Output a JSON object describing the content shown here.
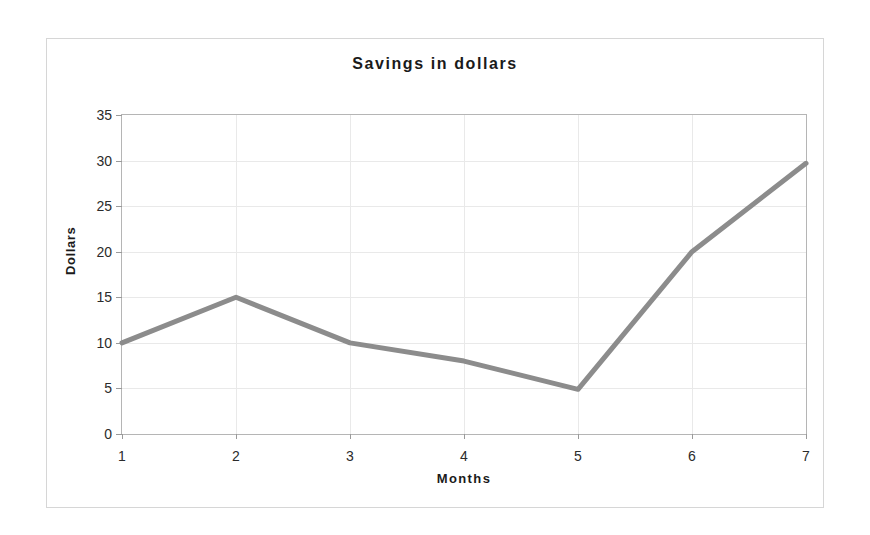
{
  "chart_data": {
    "type": "line",
    "title": "Savings in dollars",
    "xlabel": "Months",
    "ylabel": "Dollars",
    "x": [
      1,
      2,
      3,
      4,
      5,
      6,
      7
    ],
    "values": [
      10,
      15,
      10,
      8,
      4.9,
      20,
      29.7
    ],
    "categories": [
      "1",
      "2",
      "3",
      "4",
      "5",
      "6",
      "7"
    ],
    "xtick_labels": [
      "1",
      "2",
      "3",
      "4",
      "5",
      "6",
      "7"
    ],
    "ytick_labels": [
      "0",
      "5",
      "10",
      "15",
      "20",
      "25",
      "30",
      "35"
    ],
    "ytick_values": [
      0,
      5,
      10,
      15,
      20,
      25,
      30,
      35
    ],
    "xlim": [
      1,
      7
    ],
    "ylim": [
      0,
      35
    ],
    "grid": true,
    "legend": false,
    "series": [
      {
        "name": "Savings",
        "values": [
          10,
          15,
          10,
          8,
          4.9,
          20,
          29.7
        ],
        "color": "#8c8c8c",
        "line_width": 5
      }
    ],
    "colors": {
      "line": "#8c8c8c",
      "gridline": "#e9e9e9",
      "axis": "#b5b5b5",
      "frame": "#d6d6d6",
      "text": "#1a1a1a",
      "background": "#ffffff"
    }
  }
}
